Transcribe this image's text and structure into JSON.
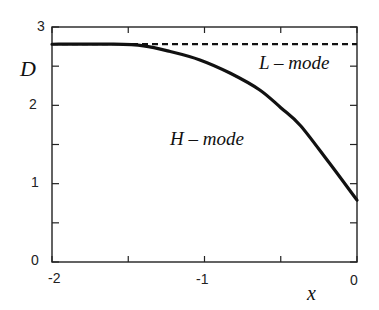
{
  "chart_data": {
    "type": "line",
    "title": "",
    "xlabel": "x",
    "ylabel": "D",
    "xlim": [
      -2,
      0
    ],
    "ylim": [
      0,
      3
    ],
    "grid": false,
    "x_ticks": [
      -2,
      -1.5,
      -1,
      -0.5,
      0
    ],
    "x_tick_labels": [
      "-2",
      "-1",
      "0"
    ],
    "y_ticks": [
      0,
      0.5,
      1,
      1.5,
      2,
      2.5,
      3
    ],
    "y_tick_labels": [
      "0",
      "1",
      "2",
      "3"
    ],
    "series": [
      {
        "name": "L - mode",
        "style": "dashed",
        "x": [
          -2,
          -1.5,
          -1,
          -0.5,
          0
        ],
        "values": [
          2.78,
          2.78,
          2.78,
          2.78,
          2.78
        ]
      },
      {
        "name": "H - mode",
        "style": "solid",
        "x": [
          -2,
          -1.6,
          -1.4,
          -1.23,
          -1.03,
          -0.83,
          -0.64,
          -0.5,
          -0.37,
          -0.18,
          0
        ],
        "values": [
          2.78,
          2.78,
          2.76,
          2.69,
          2.58,
          2.41,
          2.2,
          1.97,
          1.74,
          1.26,
          0.79
        ]
      }
    ],
    "annotations": [
      "L - mode",
      "H - mode"
    ]
  },
  "labels": {
    "y_axis": "D",
    "x_axis": "x",
    "l_mode": "L – mode",
    "h_mode": "H – mode",
    "ytick_0": "0",
    "ytick_1": "1",
    "ytick_2": "2",
    "ytick_3": "3",
    "xtick_m2": "-2",
    "xtick_m1": "-1",
    "xtick_0": "0"
  }
}
